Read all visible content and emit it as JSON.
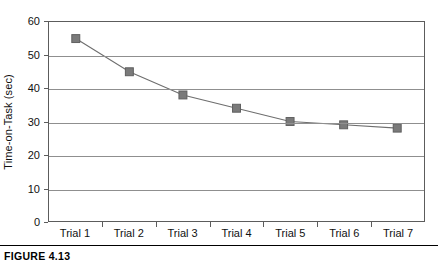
{
  "caption": "FIGURE 4.13",
  "colors": {
    "marker_fill": "#7a7a7a",
    "marker_stroke": "#5f5f5f",
    "line": "#6e6e6e",
    "gridline": "#8f8f8f",
    "axis": "#5c5c5c",
    "text": "#111111",
    "background": "#ffffff"
  },
  "chart_data": {
    "type": "line",
    "title": "",
    "subtitle": "",
    "xlabel": "",
    "ylabel": "Time-on-Task (sec)",
    "categories": [
      "Trial 1",
      "Trial 2",
      "Trial 3",
      "Trial 4",
      "Trial 5",
      "Trial 6",
      "Trial 7"
    ],
    "values": [
      55,
      45,
      38,
      34,
      30,
      29,
      28
    ],
    "series": [
      {
        "name": "Time-on-Task",
        "values": [
          55,
          45,
          38,
          34,
          30,
          29,
          28
        ]
      }
    ],
    "ylim": [
      0,
      60
    ],
    "ytick_labels": [
      "0",
      "10",
      "20",
      "30",
      "40",
      "50",
      "60"
    ],
    "ytick_values": [
      0,
      10,
      20,
      30,
      40,
      50,
      60
    ],
    "ytick_interval": 10,
    "grid": "horizontal",
    "legend": "none",
    "marker": "square",
    "annotations": []
  }
}
